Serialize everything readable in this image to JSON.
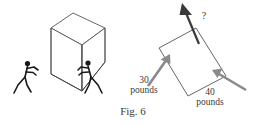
{
  "figure": {
    "caption": "Fig. 6",
    "background_color": "#ffffff",
    "ink_color": "#2b2b2b",
    "arrow_color": "#8a8a8a",
    "resultant_color": "#3a3a3a"
  },
  "left_panel": {
    "name": "cube-pushed-by-two-people",
    "box": {
      "shape": "cube",
      "projection": "isometric",
      "stroke_color": "#555555",
      "fill_color": "#ffffff"
    },
    "figures": [
      {
        "name": "stick-figure-left",
        "action": "pushing",
        "facing": "right"
      },
      {
        "name": "stick-figure-right",
        "action": "pushing",
        "facing": "left"
      }
    ]
  },
  "right_panel": {
    "name": "force-vector-diagram",
    "block": {
      "shape": "rectangle",
      "rotation_degrees": -22,
      "stroke_color": "#555555",
      "fill_color": "#ffffff"
    },
    "forces": [
      {
        "name": "force-left",
        "magnitude": "30",
        "unit": "pounds",
        "label_line1": "30",
        "label_line2": "pounds",
        "color": "#8a8a8a",
        "direction": "up-right"
      },
      {
        "name": "force-right",
        "magnitude": "40",
        "unit": "pounds",
        "label_line1": "40",
        "label_line2": "pounds",
        "color": "#8a8a8a",
        "direction": "up-left"
      }
    ],
    "resultant": {
      "name": "resultant-force",
      "label": "?",
      "color": "#3a3a3a",
      "direction": "up-left"
    }
  }
}
